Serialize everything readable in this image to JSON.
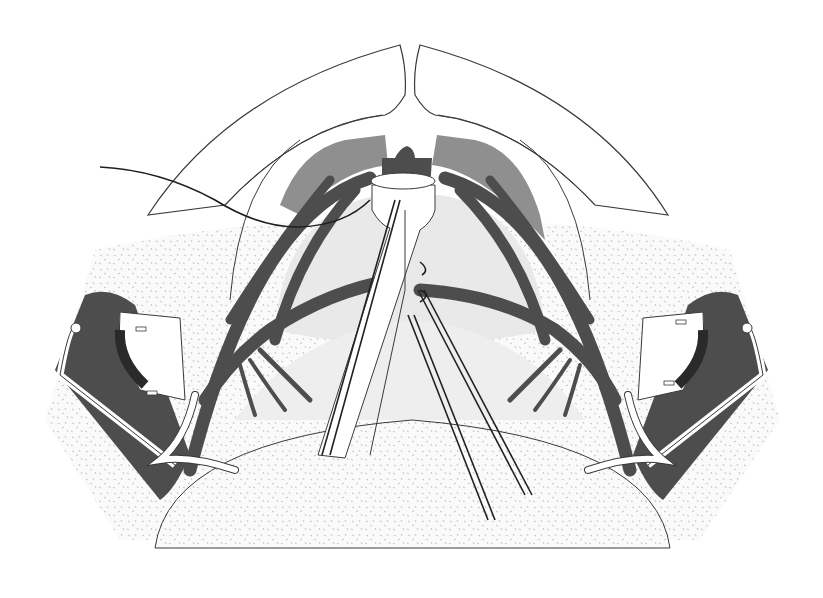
{
  "figure": {
    "type": "anatomical-surgical-illustration",
    "style": "grayscale line art with stippled tissue",
    "labels": [],
    "structures": [
      "outer-arch-skin-flaps",
      "midline-cleft",
      "inner-arch",
      "muscle-flaps-left-right",
      "central-dark-tissue-plug",
      "central-tube-sleeve",
      "suture-thread-left",
      "branching-vessels-left-right",
      "light-inner-cavity",
      "stippled-tissue-field",
      "lower-dome-mass",
      "retractor-left",
      "retractor-right",
      "loop-drains-left-right",
      "parallel-wire-pairs"
    ]
  },
  "colors": {
    "background": "#ffffff",
    "outline": "#3a3a3a",
    "vessel": "#4d4d4d",
    "muscle": "#8f8f8f",
    "cavity": "#e9e9e9",
    "stipple_base": "#fafafa",
    "stipple_dot": "#b5b5b5",
    "wire": "#222222",
    "tube": "#ffffff"
  }
}
